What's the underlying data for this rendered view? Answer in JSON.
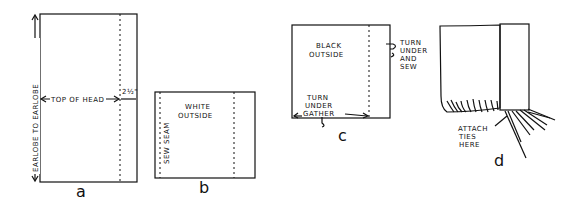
{
  "figures": {
    "a": {
      "caption": "a",
      "vertical_label": "EARLOBE TO EARLOBE",
      "horizontal_label": "TOP OF HEAD",
      "margin_label": "2½\""
    },
    "b": {
      "caption": "b",
      "outside_label_1": "WHITE",
      "outside_label_2": "OUTSIDE",
      "seam_label": "SEW SEAM"
    },
    "c": {
      "caption": "c",
      "outside_label_1": "BLACK",
      "outside_label_2": "OUTSIDE",
      "side_note": [
        "TURN",
        "UNDER",
        "AND",
        "SEW"
      ],
      "bottom_note": [
        "TURN",
        "UNDER",
        "GATHER"
      ]
    },
    "d": {
      "caption": "d",
      "ties_note": [
        "ATTACH",
        "TIES",
        "HERE"
      ]
    }
  }
}
